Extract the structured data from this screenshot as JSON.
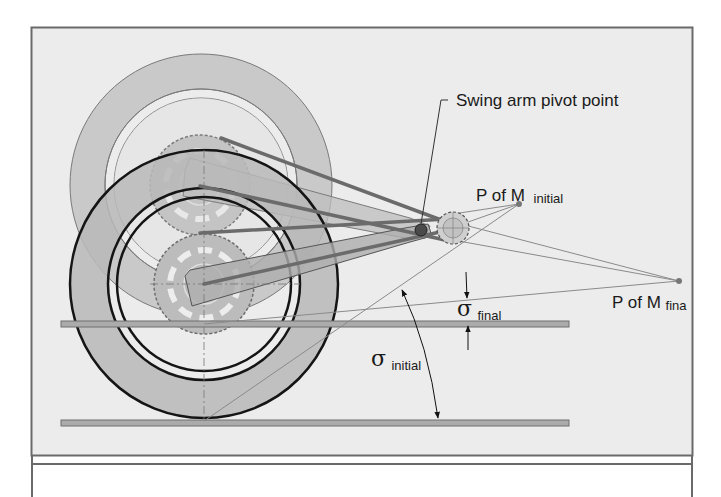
{
  "diagram": {
    "colors": {
      "panel_bg": "#ececec",
      "frame": "#6a6a6a",
      "tire_fill": "#b9b9b9",
      "tire_outline": "#151515",
      "ghost_tire_fill": "#c8c8c8",
      "ghost_outline": "#7a7a7a",
      "sprocket_fill": "#bdbdbd",
      "swingarm_fill": "#b0b0b0",
      "chain_line": "#6d6d6d",
      "construction_line": "#8c8c8c",
      "ground_bar": "#a9a9a9"
    },
    "labels": {
      "pivot": "Swing arm pivot point",
      "pom_initial_main": "P of M",
      "pom_initial_sub": "initial",
      "pom_final_main": "P of M",
      "pom_final_sub": "fina",
      "sigma_symbol": "σ",
      "sigma_final_sub": "final",
      "sigma_initial_sub": "initial"
    },
    "points": {
      "pivot": [
        421,
        230
      ],
      "front_sprocket": [
        453,
        228
      ],
      "pom_initial": [
        519,
        204
      ],
      "pom_final": [
        679,
        281
      ],
      "wheel_initial_axle": [
        201,
        185
      ],
      "wheel_final_axle": [
        204,
        284
      ],
      "contact_patch": [
        204,
        421
      ]
    },
    "ground_lines": [
      {
        "name": "ground-line-upper",
        "y": 324,
        "x1": 61,
        "x2": 569
      },
      {
        "name": "ground-line-lower",
        "y": 423,
        "x1": 61,
        "x2": 569
      }
    ]
  }
}
